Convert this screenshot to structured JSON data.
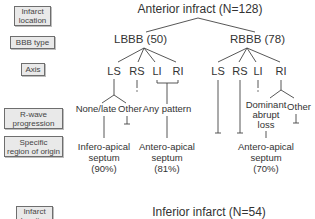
{
  "legend": {
    "infarct_location": [
      "Infarct",
      "location"
    ],
    "bbb_type": "BBB type",
    "axis": "Axis",
    "r_wave": [
      "R-wave",
      "progression"
    ],
    "region": [
      "Specific",
      "region of origin"
    ],
    "infarct_location_2": [
      "Infarct",
      "location"
    ]
  },
  "anterior": {
    "title": "Anterior infract (N=128)",
    "lbbb": {
      "label": "LBBB (50)",
      "axes": [
        "LS",
        "RS",
        "LI",
        "RI"
      ],
      "r_wave": [
        "None/late",
        "Other",
        "Any pattern"
      ],
      "regions": [
        {
          "lines": [
            "Infero-apical",
            "septum",
            "(90%)"
          ]
        },
        {
          "lines": [
            "Antero-apical",
            "septum",
            "(81%)"
          ]
        }
      ]
    },
    "rbbb": {
      "label": "RBBB (78)",
      "axes": [
        "LS",
        "RS",
        "LI",
        "RI"
      ],
      "r_wave": [
        "Dominant",
        "abrupt",
        "loss",
        "Other"
      ],
      "region": {
        "lines": [
          "Antero-apical",
          "septum",
          "(70%)"
        ]
      }
    }
  },
  "inferior": {
    "title": "Inferior infarct (N=54)"
  }
}
